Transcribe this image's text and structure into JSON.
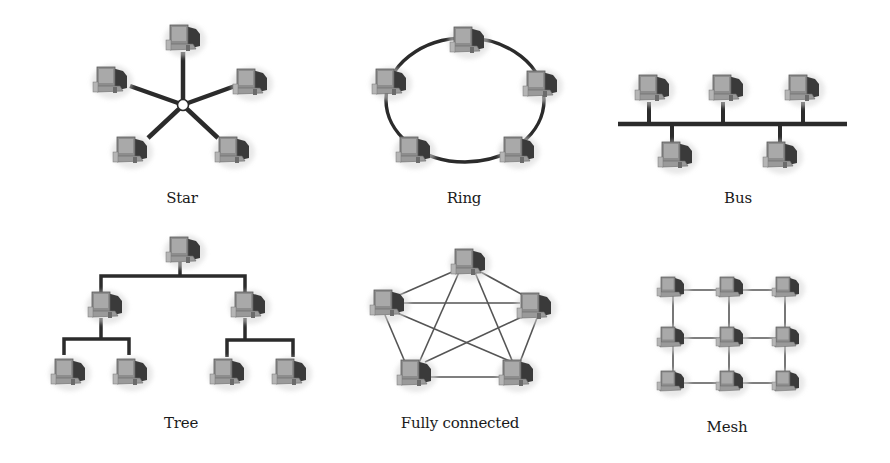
{
  "figure": {
    "colors": {
      "background": "#ffffff",
      "link": "#2b2b2b",
      "computer_body": "#8a8a8a",
      "computer_dark": "#333333",
      "computer_screen": "#a8a8a8",
      "label": "#1a1a1a"
    },
    "node_icon": "computer-icon",
    "topologies": [
      {
        "id": "star",
        "label": "Star",
        "label_pos": [
          182,
          200
        ],
        "hub": [
          183,
          105
        ],
        "nodes": [
          [
            183,
            38
          ],
          [
            110,
            80
          ],
          [
            250,
            82
          ],
          [
            130,
            150
          ],
          [
            232,
            150
          ]
        ],
        "links": [
          [
            0,
            "hub"
          ],
          [
            1,
            "hub"
          ],
          [
            2,
            "hub"
          ],
          [
            3,
            "hub"
          ],
          [
            4,
            "hub"
          ]
        ]
      },
      {
        "id": "ring",
        "label": "Ring",
        "label_pos": [
          464,
          200
        ],
        "ring_center": [
          465,
          95
        ],
        "ring_radius": [
          82,
          65
        ],
        "nodes": [
          [
            467,
            40
          ],
          [
            388,
            82
          ],
          [
            540,
            82
          ],
          [
            412,
            150
          ],
          [
            516,
            150
          ]
        ]
      },
      {
        "id": "bus",
        "label": "Bus",
        "label_pos": [
          738,
          200
        ],
        "bus_line": [
          [
            618,
            124
          ],
          [
            847,
            124
          ]
        ],
        "nodes_top": [
          [
            652,
            90
          ],
          [
            725,
            90
          ],
          [
            802,
            90
          ]
        ],
        "nodes_bottom": [
          [
            675,
            155
          ],
          [
            780,
            155
          ]
        ]
      },
      {
        "id": "tree",
        "label": "Tree",
        "label_pos": [
          180,
          433
        ],
        "nodes": [
          [
            182,
            250
          ],
          [
            104,
            305
          ],
          [
            247,
            305
          ],
          [
            64,
            370
          ],
          [
            128,
            370
          ],
          [
            226,
            370
          ],
          [
            290,
            370
          ]
        ],
        "links": [
          [
            0,
            1
          ],
          [
            0,
            2
          ],
          [
            1,
            3
          ],
          [
            1,
            4
          ],
          [
            2,
            5
          ],
          [
            2,
            6
          ]
        ]
      },
      {
        "id": "fully-connected",
        "label": "Fully connected",
        "label_pos": [
          460,
          433
        ],
        "nodes": [
          [
            468,
            262
          ],
          [
            387,
            303
          ],
          [
            534,
            305
          ],
          [
            414,
            372
          ],
          [
            516,
            372
          ]
        ],
        "links": [
          [
            0,
            1
          ],
          [
            0,
            2
          ],
          [
            0,
            3
          ],
          [
            0,
            4
          ],
          [
            1,
            2
          ],
          [
            1,
            3
          ],
          [
            1,
            4
          ],
          [
            2,
            3
          ],
          [
            2,
            4
          ],
          [
            3,
            4
          ]
        ]
      },
      {
        "id": "mesh",
        "label": "Mesh",
        "label_pos": [
          728,
          437
        ],
        "grid_cols": [
          671,
          730,
          786
        ],
        "grid_rows": [
          287,
          337,
          380
        ],
        "links": "horizontal-and-vertical neighbors"
      }
    ]
  }
}
